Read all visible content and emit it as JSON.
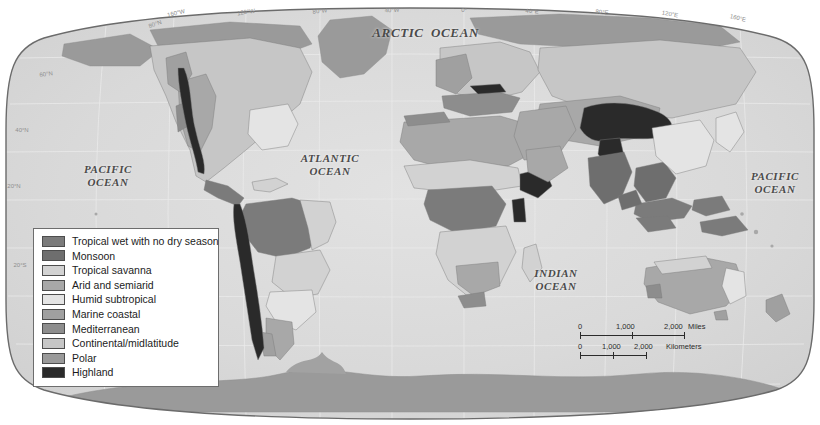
{
  "map": {
    "title": "World Climate Regions",
    "projection": "Robinson-style oval world projection",
    "ocean_color": "#d9d9d9",
    "frame_color": "#6b6b6b",
    "ocean_labels": [
      {
        "name": "arctic-ocean",
        "line1": "ARCTIC",
        "line2": "OCEAN",
        "inline": true,
        "x": 398,
        "y": 33,
        "size": 13
      },
      {
        "name": "pacific-ocean-west",
        "line1": "PACIFIC",
        "line2": "OCEAN",
        "inline": false,
        "x": 108,
        "y": 176,
        "size": 11
      },
      {
        "name": "atlantic-ocean",
        "line1": "ATLANTIC",
        "line2": "OCEAN",
        "inline": false,
        "x": 330,
        "y": 165,
        "size": 11
      },
      {
        "name": "indian-ocean",
        "line1": "INDIAN",
        "line2": "OCEAN",
        "inline": false,
        "x": 556,
        "y": 280,
        "size": 11
      },
      {
        "name": "pacific-ocean-east",
        "line1": "PACIFIC",
        "line2": "OCEAN",
        "inline": false,
        "x": 775,
        "y": 183,
        "size": 11
      }
    ],
    "longitude_labels": [
      {
        "text": "160°W",
        "x": 176,
        "y": 13
      },
      {
        "text": "120°W",
        "x": 246,
        "y": 13
      },
      {
        "text": "80°W",
        "x": 320,
        "y": 13
      },
      {
        "text": "40°W",
        "x": 392,
        "y": 13
      },
      {
        "text": "0°",
        "x": 464,
        "y": 13
      },
      {
        "text": "40°E",
        "x": 530,
        "y": 13
      },
      {
        "text": "80°E",
        "x": 600,
        "y": 13
      },
      {
        "text": "120°E",
        "x": 668,
        "y": 13
      },
      {
        "text": "160°E",
        "x": 738,
        "y": 13
      }
    ],
    "latitude_labels": [
      {
        "text": "80°N",
        "x": 155,
        "y": 22
      },
      {
        "text": "60°N",
        "x": 44,
        "y": 72
      },
      {
        "text": "40°N",
        "x": 20,
        "y": 130
      },
      {
        "text": "20°N",
        "x": 12,
        "y": 186
      },
      {
        "text": "20°S",
        "x": 18,
        "y": 265
      }
    ]
  },
  "legend": {
    "items": [
      {
        "label": "Tropical wet with no dry season",
        "color": "#7b7b7b"
      },
      {
        "label": "Monsoon",
        "color": "#6e6e6e"
      },
      {
        "label": "Tropical savanna",
        "color": "#d2d2d2"
      },
      {
        "label": "Arid and semiarid",
        "color": "#a8a8a8"
      },
      {
        "label": "Humid subtropical",
        "color": "#e4e4e4"
      },
      {
        "label": "Marine coastal",
        "color": "#a0a0a0"
      },
      {
        "label": "Mediterranean",
        "color": "#8d8d8d"
      },
      {
        "label": "Continental/midlatitude",
        "color": "#c6c6c6"
      },
      {
        "label": "Polar",
        "color": "#9a9a9a"
      },
      {
        "label": "Highland",
        "color": "#2a2a2a"
      }
    ]
  },
  "scale": {
    "miles": {
      "unit_label": "Miles",
      "ticks": [
        "0",
        "1,000",
        "2,000"
      ]
    },
    "kilometers": {
      "unit_label": "Kilometers",
      "ticks": [
        "0",
        "1,000",
        "2,000"
      ]
    }
  }
}
